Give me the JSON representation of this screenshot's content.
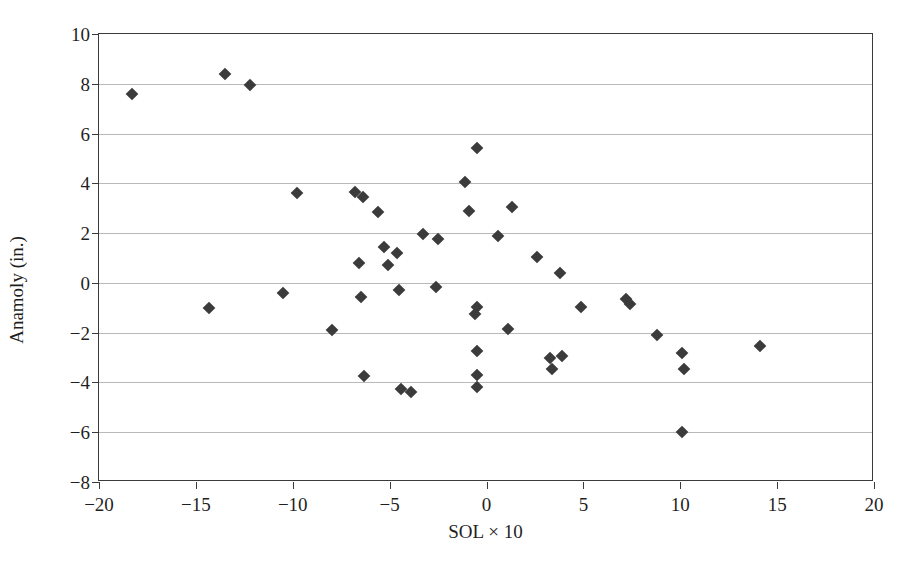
{
  "chart_data": {
    "type": "scatter",
    "title": "",
    "xlabel": "SOL × 10",
    "ylabel": "Anamoly (in.)",
    "xlim": [
      -20,
      20
    ],
    "ylim": [
      -8,
      10
    ],
    "xticks": [
      -20,
      -15,
      -10,
      -5,
      0,
      5,
      10,
      15,
      20
    ],
    "yticks": [
      -8,
      -6,
      -4,
      -2,
      0,
      2,
      4,
      6,
      8,
      10
    ],
    "xtick_labels": [
      "−20",
      "−15",
      "−10",
      "−5",
      "0",
      "5",
      "10",
      "15",
      "20"
    ],
    "ytick_labels": [
      "−8",
      "−6",
      "−4",
      "−2",
      "0",
      "2",
      "4",
      "6",
      "8",
      "10"
    ],
    "grid": "horizontal",
    "legend": null,
    "marker": "diamond",
    "marker_color": "#3b3b3b",
    "series": [
      {
        "name": "Anamoly vs SOL",
        "points": [
          [
            -18.3,
            7.6
          ],
          [
            -13.5,
            8.4
          ],
          [
            -12.2,
            7.95
          ],
          [
            -14.3,
            -1.0
          ],
          [
            -10.5,
            -0.4
          ],
          [
            -9.8,
            3.6
          ],
          [
            -8.0,
            -1.9
          ],
          [
            -6.8,
            3.65
          ],
          [
            -6.4,
            3.45
          ],
          [
            -6.6,
            0.8
          ],
          [
            -6.5,
            -0.55
          ],
          [
            -6.3,
            -3.75
          ],
          [
            -5.6,
            2.85
          ],
          [
            -5.3,
            1.45
          ],
          [
            -5.1,
            0.7
          ],
          [
            -4.6,
            1.2
          ],
          [
            -4.5,
            -0.3
          ],
          [
            -4.4,
            -4.25
          ],
          [
            -3.9,
            -4.4
          ],
          [
            -3.3,
            1.95
          ],
          [
            -2.5,
            1.75
          ],
          [
            -2.6,
            -0.15
          ],
          [
            -1.1,
            4.05
          ],
          [
            -0.5,
            5.4
          ],
          [
            -0.9,
            2.9
          ],
          [
            -0.5,
            -0.95
          ],
          [
            -0.6,
            -1.25
          ],
          [
            -0.5,
            -2.75
          ],
          [
            -0.5,
            -3.7
          ],
          [
            -0.5,
            -4.2
          ],
          [
            0.6,
            1.9
          ],
          [
            1.3,
            3.05
          ],
          [
            1.1,
            -1.85
          ],
          [
            2.6,
            1.05
          ],
          [
            3.8,
            0.4
          ],
          [
            3.3,
            -3.0
          ],
          [
            3.9,
            -2.95
          ],
          [
            3.4,
            -3.45
          ],
          [
            4.9,
            -0.95
          ],
          [
            7.2,
            -0.65
          ],
          [
            7.4,
            -0.85
          ],
          [
            8.8,
            -2.1
          ],
          [
            10.1,
            -2.8
          ],
          [
            10.2,
            -3.45
          ],
          [
            10.1,
            -6.0
          ],
          [
            14.1,
            -2.55
          ]
        ]
      }
    ]
  }
}
